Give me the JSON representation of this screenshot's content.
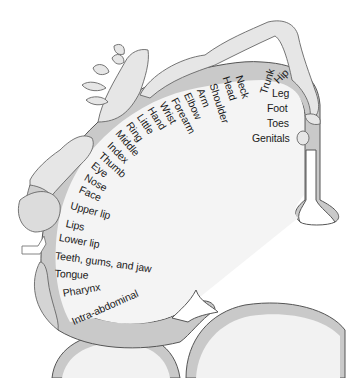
{
  "diagram": {
    "colors": {
      "background": "#ffffff",
      "cortex_fill": "#f2f2f2",
      "gray_matter": "#c9c9c9",
      "outline": "#555555",
      "figure_fill": "#e6e6e6",
      "text": "#1a1a1a"
    },
    "labels": [
      {
        "text": "Genitals",
        "x": 252,
        "y": 133,
        "rot": 0
      },
      {
        "text": "Toes",
        "x": 267,
        "y": 118,
        "rot": 0
      },
      {
        "text": "Foot",
        "x": 267,
        "y": 103,
        "rot": 0
      },
      {
        "text": "Leg",
        "x": 272,
        "y": 88,
        "rot": 0
      },
      {
        "text": "Hip",
        "x": 272,
        "y": 78,
        "rot": -45
      },
      {
        "text": "Trunk",
        "x": 258,
        "y": 92,
        "rot": -72
      },
      {
        "text": "Neck",
        "x": 244,
        "y": 74,
        "rot": 72
      },
      {
        "text": "Head",
        "x": 231,
        "y": 75,
        "rot": 72
      },
      {
        "text": "Shoulder",
        "x": 218,
        "y": 82,
        "rot": 72
      },
      {
        "text": "Arm",
        "x": 205,
        "y": 87,
        "rot": 68
      },
      {
        "text": "Elbow",
        "x": 192,
        "y": 91,
        "rot": 65
      },
      {
        "text": "Forearm",
        "x": 179,
        "y": 96,
        "rot": 62
      },
      {
        "text": "Wrist",
        "x": 167,
        "y": 100,
        "rot": 60
      },
      {
        "text": "Hand",
        "x": 155,
        "y": 105,
        "rot": 58
      },
      {
        "text": "Little",
        "x": 144,
        "y": 112,
        "rot": 56
      },
      {
        "text": "Ring",
        "x": 133,
        "y": 120,
        "rot": 54
      },
      {
        "text": "Middle",
        "x": 122,
        "y": 128,
        "rot": 50
      },
      {
        "text": "Index",
        "x": 113,
        "y": 140,
        "rot": 45
      },
      {
        "text": "Thumb",
        "x": 104,
        "y": 150,
        "rot": 42
      },
      {
        "text": "Eye",
        "x": 96,
        "y": 160,
        "rot": 38
      },
      {
        "text": "Nose",
        "x": 88,
        "y": 172,
        "rot": 30
      },
      {
        "text": "Face",
        "x": 82,
        "y": 184,
        "rot": 24
      },
      {
        "text": "Upper lip",
        "x": 72,
        "y": 200,
        "rot": 15
      },
      {
        "text": "Lips",
        "x": 67,
        "y": 218,
        "rot": 12
      },
      {
        "text": "Lower lip",
        "x": 60,
        "y": 232,
        "rot": 10
      },
      {
        "text": "Teeth, gums, and jaw",
        "x": 56,
        "y": 250,
        "rot": 8
      },
      {
        "text": "Tongue",
        "x": 55,
        "y": 268,
        "rot": 3
      },
      {
        "text": "Pharynx",
        "x": 62,
        "y": 288,
        "rot": -10
      },
      {
        "text": "Intra-abdominal",
        "x": 70,
        "y": 317,
        "rot": -24
      }
    ]
  }
}
